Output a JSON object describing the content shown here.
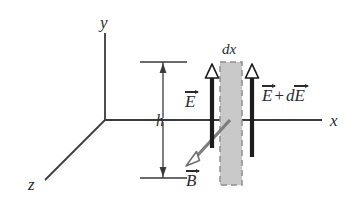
{
  "figure": {
    "type": "physics-diagram",
    "background_color": "#ffffff"
  },
  "axes": {
    "x_label": "x",
    "y_label": "y",
    "z_label": "z",
    "color": "#3a3a3a",
    "origin": {
      "x": 105,
      "y": 120
    }
  },
  "dimension": {
    "label": "h",
    "top_tick_y": 62,
    "bottom_tick_y": 178,
    "line_x": 163
  },
  "slab": {
    "label": "dx",
    "fill_color": "#c8c8c8",
    "border_style": "dashed",
    "border_color": "#8a8a8a",
    "x": 220,
    "y": 62,
    "width": 22,
    "height": 123
  },
  "field_arrows": [
    {
      "name": "E",
      "label_parts": {
        "symbol": "E"
      },
      "color": "#1c1c1c",
      "direction": "up"
    },
    {
      "name": "E_plus_dE",
      "label_parts": {
        "symbol1": "E",
        "operator": "+",
        "prefix": "d",
        "symbol2": "E"
      },
      "color": "#1c1c1c",
      "direction": "up"
    }
  ],
  "b_field": {
    "label": "B",
    "color": "#7d7d7d",
    "direction": "down-left",
    "arrowhead": "hollow",
    "start": {
      "x": 229,
      "y": 121
    },
    "end": {
      "x": 189,
      "y": 164
    }
  },
  "labels": {
    "dx": "dx",
    "h": "h",
    "x": "x",
    "y": "y",
    "z": "z",
    "E": "E",
    "plus": "+",
    "d": "d",
    "B": "B"
  }
}
